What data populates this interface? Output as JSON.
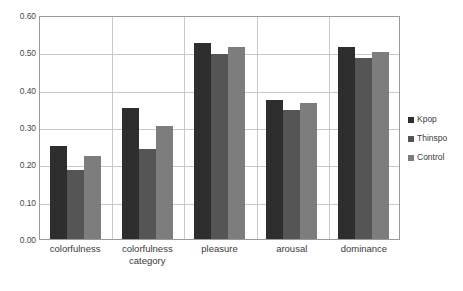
{
  "chart_data": {
    "type": "bar",
    "title": "",
    "subtitle": "",
    "xlabel": "",
    "ylabel": "",
    "ylim": [
      0.0,
      0.6
    ],
    "ytick_labels": [
      "0.60",
      "0.50",
      "0.40",
      "0.30",
      "0.20",
      "0.10",
      "0.00"
    ],
    "ytick_values": [
      0.6,
      0.5,
      0.4,
      0.3,
      0.2,
      0.1,
      0.0
    ],
    "grid": true,
    "legend_position": "right",
    "categories": [
      "colorfulness",
      "colorfulness category",
      "pleasure",
      "arousal",
      "dominance"
    ],
    "category_lines": [
      [
        "colorfulness"
      ],
      [
        "colorfulness",
        "category"
      ],
      [
        "pleasure"
      ],
      [
        "arousal"
      ],
      [
        "dominance"
      ]
    ],
    "series": [
      {
        "name": "Kpop",
        "color": "#2e2e2e",
        "values": [
          0.25,
          0.35,
          0.525,
          0.372,
          0.515
        ]
      },
      {
        "name": "Thinspo",
        "color": "#555555",
        "values": [
          0.185,
          0.24,
          0.495,
          0.345,
          0.485
        ]
      },
      {
        "name": "Control",
        "color": "#7d7d7d",
        "values": [
          0.222,
          0.303,
          0.515,
          0.365,
          0.5
        ]
      }
    ]
  },
  "legend": {
    "items": [
      {
        "label": "Kpop",
        "color": "#2e2e2e"
      },
      {
        "label": "Thinspo",
        "color": "#555555"
      },
      {
        "label": "Control",
        "color": "#7d7d7d"
      }
    ]
  },
  "colors": {
    "plot_border": "#9a9a9a",
    "gridline": "#c9c9c9",
    "background": "#ffffff",
    "tick_text": "#4a4a4a",
    "category_text": "#3a3a3a"
  }
}
